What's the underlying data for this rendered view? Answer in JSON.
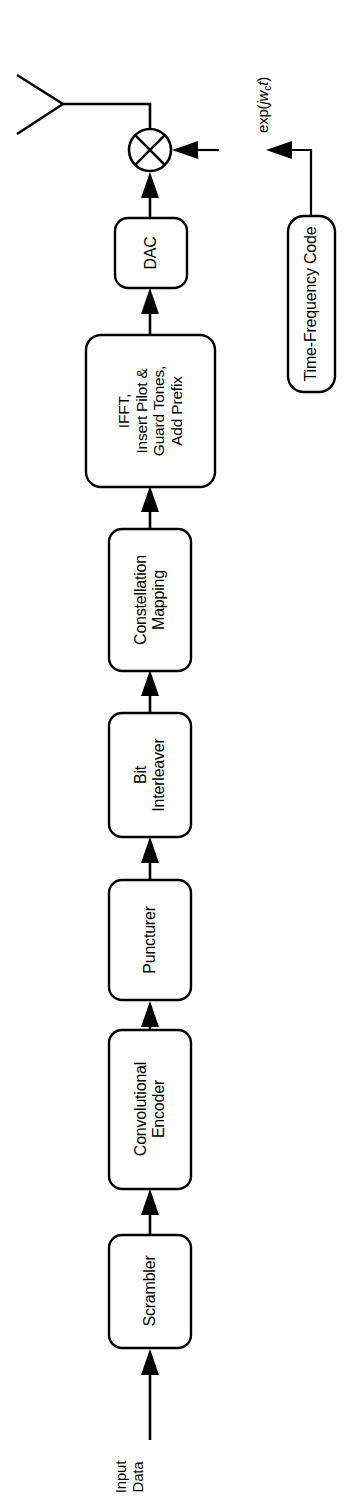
{
  "diagram": {
    "orientation": "rotated-90-ccw",
    "background_color": "#ffffff",
    "line_color": "#000000",
    "input_label": {
      "line1": "Input",
      "line2": "Data"
    },
    "carrier_label": {
      "prefix": "exp(",
      "italic_j": "j",
      "italic_w": "w",
      "subscript": "c",
      "italic_t": "t",
      "suffix": ")",
      "full_text": "exp(jw_c t)"
    },
    "blocks": [
      {
        "id": "scrambler",
        "lines": [
          "Scrambler"
        ]
      },
      {
        "id": "convolutional-encoder",
        "lines": [
          "Convolutional",
          "Encoder"
        ]
      },
      {
        "id": "puncturer",
        "lines": [
          "Puncturer"
        ]
      },
      {
        "id": "bit-interleaver",
        "lines": [
          "Bit",
          "Interleaver"
        ]
      },
      {
        "id": "constellation-mapping",
        "lines": [
          "Constellation",
          "Mapping"
        ]
      },
      {
        "id": "ifft-insert-pilot",
        "lines": [
          "IFFT,",
          "Insert Pilot &",
          "Guard Tones,",
          "Add Prefix"
        ]
      },
      {
        "id": "dac",
        "lines": [
          "DAC"
        ]
      },
      {
        "id": "time-frequency-code",
        "lines": [
          "Time-Frequency Code"
        ]
      }
    ],
    "mixer": {
      "symbol": "multiply-cross"
    },
    "antenna": {
      "symbol": "antenna"
    }
  }
}
